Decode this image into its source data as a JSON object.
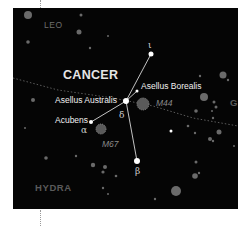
{
  "map": {
    "background": "#050505",
    "constellations": {
      "main": "CANCER",
      "neighbors": [
        "LEO",
        "HYDRA",
        "G"
      ]
    },
    "stars": {
      "iota": {
        "greek": "ι"
      },
      "asellus_borealis": {
        "name": "Asellus Borealis"
      },
      "asellus_australis": {
        "name": "Asellus Australis",
        "greek": "δ"
      },
      "acubens": {
        "name": "Acubens",
        "greek": "α"
      },
      "beta": {
        "greek": "β"
      }
    },
    "clusters": [
      {
        "id": "M44",
        "label": "M44"
      },
      {
        "id": "M67",
        "label": "M67"
      }
    ],
    "ecliptic": "dotted-line",
    "colors": {
      "figure_line": "#d8d8d8",
      "bright_star": "#ffffff",
      "background_star": "#6a6a6a",
      "cluster": "#6f6f6f"
    }
  }
}
